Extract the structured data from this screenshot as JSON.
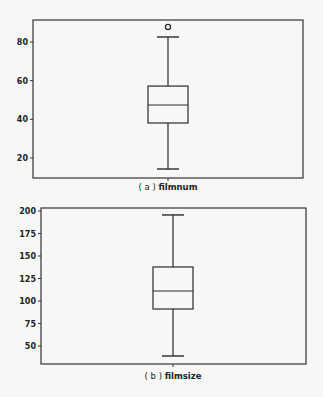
{
  "chart_data": [
    {
      "type": "box",
      "title": "",
      "caption_prefix": "( a )",
      "caption_label": "filmnum",
      "xlabel": "",
      "ylabel": "",
      "ylim": [
        11,
        91
      ],
      "yticks": [
        20,
        40,
        60,
        80
      ],
      "grid": false,
      "legend": null,
      "series": [
        {
          "name": "filmnum",
          "whisker_low": 14.3,
          "q1": 38.1,
          "median": 47.4,
          "q3": 57.2,
          "whisker_high": 82.6,
          "outliers": [
            87.8
          ]
        }
      ]
    },
    {
      "type": "box",
      "title": "",
      "caption_prefix": "( b )",
      "caption_label": "filmsize",
      "xlabel": "",
      "ylabel": "",
      "ylim": [
        30,
        203
      ],
      "yticks": [
        50,
        75,
        100,
        125,
        150,
        175,
        200
      ],
      "grid": false,
      "legend": null,
      "series": [
        {
          "name": "filmsize",
          "whisker_low": 38.9,
          "q1": 91.1,
          "median": 111.1,
          "q3": 137.8,
          "whisker_high": 195.6,
          "outliers": []
        }
      ]
    }
  ],
  "layout": [
    {
      "frame": {
        "x0": 33,
        "y0": 20,
        "x1": 303,
        "y1": 178
      },
      "ref": {
        "v0": 80,
        "p0": 42,
        "v1": 20,
        "p1": 158
      },
      "center_x": 168,
      "half_width": 20,
      "cap_half": 11,
      "caption_y": 190
    },
    {
      "frame": {
        "x0": 41,
        "y0": 208,
        "x1": 306,
        "y1": 364
      },
      "ref": {
        "v0": 200,
        "p0": 211,
        "v1": 50,
        "p1": 346
      },
      "center_x": 173,
      "half_width": 20,
      "cap_half": 11,
      "caption_y": 379
    }
  ],
  "colors": {
    "line": "#2b2b2b",
    "frame": "#333333",
    "background": "#f7f7f5"
  }
}
